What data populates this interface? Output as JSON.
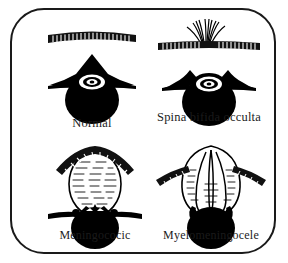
{
  "figure": {
    "type": "medical-illustration",
    "frame_color": "#1a1a1a",
    "background_color": "#ffffff",
    "ink_color": "#000000"
  },
  "panels": [
    {
      "id": "normal",
      "label": "Normal",
      "skin_layer": "intact-hatched-skin-strip",
      "has_hair_tuft": false,
      "vertebra": "closed-arch-pointed-spinous-process",
      "sac": "none",
      "cord_body": "solid-black-vertebral-body"
    },
    {
      "id": "occulta",
      "label": "Spina bifida occulta",
      "skin_layer": "intact-hatched-skin-strip",
      "has_hair_tuft": true,
      "vertebra": "split-open-arch-no-spinous-process",
      "sac": "none",
      "cord_body": "solid-black-vertebral-body"
    },
    {
      "id": "meningocele",
      "label": "Meningococic",
      "skin_layer": "stretched-hatched-skin-over-sac",
      "has_hair_tuft": false,
      "vertebra": "split-open-arch-with-lateral-processes",
      "sac": "meningeal-sac-filled-with-csf",
      "cord_body": "solid-black-vertebral-body"
    },
    {
      "id": "myelomeningocele",
      "label": "Myelomeningocele",
      "skin_layer": "stretched-hatched-skin-over-sac",
      "has_hair_tuft": false,
      "vertebra": "split-open-arch-with-lateral-processes",
      "sac": "meningeal-sac-containing-neural-tissue",
      "cord_body": "solid-black-vertebral-body"
    }
  ]
}
